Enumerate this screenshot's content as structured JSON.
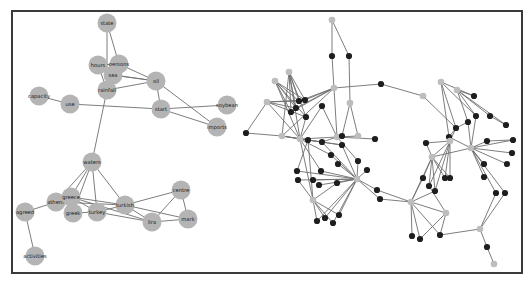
{
  "figure": {
    "colors": {
      "border": "#3a3a3a",
      "edge": "#6e6e6e",
      "word_node": "#b4b4b4",
      "dark_node": "#1e1e1e",
      "light_node": "#bdbdbd",
      "label": "#1a1a1a"
    }
  },
  "left_network": {
    "nodes": [
      {
        "id": "state",
        "label": "state",
        "x": 107,
        "y": 23
      },
      {
        "id": "hours",
        "label": "hours",
        "x": 98,
        "y": 65
      },
      {
        "id": "persons",
        "label": "persons",
        "x": 119,
        "y": 64
      },
      {
        "id": "sea",
        "label": "sea",
        "x": 113,
        "y": 75
      },
      {
        "id": "rainfall",
        "label": "rainfall",
        "x": 107,
        "y": 90
      },
      {
        "id": "oil",
        "label": "oil",
        "x": 156,
        "y": 81
      },
      {
        "id": "capacity",
        "label": "capacity",
        "x": 39,
        "y": 96
      },
      {
        "id": "use",
        "label": "use",
        "x": 70,
        "y": 104
      },
      {
        "id": "start",
        "label": "start",
        "x": 161,
        "y": 109
      },
      {
        "id": "soybean",
        "label": "soybean",
        "x": 227,
        "y": 105
      },
      {
        "id": "imports",
        "label": "imports",
        "x": 217,
        "y": 127
      },
      {
        "id": "waters",
        "label": "waters",
        "x": 92,
        "y": 162
      },
      {
        "id": "athens",
        "label": "athens",
        "x": 56,
        "y": 202
      },
      {
        "id": "greece",
        "label": "greece",
        "x": 71,
        "y": 197
      },
      {
        "id": "greek",
        "label": "greek",
        "x": 73,
        "y": 213
      },
      {
        "id": "turkey",
        "label": "turkey",
        "x": 97,
        "y": 212
      },
      {
        "id": "turkish",
        "label": "turkish",
        "x": 125,
        "y": 205
      },
      {
        "id": "centre",
        "label": "centre",
        "x": 181,
        "y": 190
      },
      {
        "id": "lira",
        "label": "lira",
        "x": 152,
        "y": 222
      },
      {
        "id": "mark",
        "label": "mark",
        "x": 188,
        "y": 219
      },
      {
        "id": "agreed",
        "label": "agreed",
        "x": 25,
        "y": 212
      },
      {
        "id": "activities",
        "label": "activities",
        "x": 35,
        "y": 256
      }
    ],
    "edges": [
      [
        "state",
        "persons"
      ],
      [
        "state",
        "rainfall"
      ],
      [
        "hours",
        "persons"
      ],
      [
        "hours",
        "rainfall"
      ],
      [
        "persons",
        "oil"
      ],
      [
        "sea",
        "oil"
      ],
      [
        "persons",
        "sea"
      ],
      [
        "sea",
        "rainfall"
      ],
      [
        "rainfall",
        "oil"
      ],
      [
        "oil",
        "start"
      ],
      [
        "oil",
        "imports"
      ],
      [
        "capacity",
        "use"
      ],
      [
        "use",
        "start"
      ],
      [
        "start",
        "soybean"
      ],
      [
        "start",
        "imports"
      ],
      [
        "rainfall",
        "waters"
      ],
      [
        "sea",
        "oil"
      ],
      [
        "waters",
        "athens"
      ],
      [
        "waters",
        "greece"
      ],
      [
        "waters",
        "greek"
      ],
      [
        "waters",
        "turkey"
      ],
      [
        "waters",
        "turkish"
      ],
      [
        "athens",
        "greece"
      ],
      [
        "athens",
        "agreed"
      ],
      [
        "agreed",
        "activities"
      ],
      [
        "greece",
        "turkey"
      ],
      [
        "greece",
        "turkish"
      ],
      [
        "greece",
        "greek"
      ],
      [
        "greek",
        "turkey"
      ],
      [
        "turkey",
        "turkish"
      ],
      [
        "turkey",
        "lira"
      ],
      [
        "greece",
        "lira"
      ],
      [
        "turkish",
        "centre"
      ],
      [
        "turkish",
        "mark"
      ],
      [
        "turkish",
        "lira"
      ],
      [
        "centre",
        "lira"
      ],
      [
        "centre",
        "mark"
      ],
      [
        "lira",
        "mark"
      ],
      [
        "athens",
        "turkish"
      ]
    ]
  },
  "right_network": {
    "nodes": [
      {
        "x": 332,
        "y": 20,
        "t": "light"
      },
      {
        "x": 332,
        "y": 56,
        "t": "dark"
      },
      {
        "x": 349,
        "y": 56,
        "t": "dark"
      },
      {
        "x": 289,
        "y": 72,
        "t": "light"
      },
      {
        "x": 275,
        "y": 81,
        "t": "light"
      },
      {
        "x": 334,
        "y": 88,
        "t": "light"
      },
      {
        "x": 267,
        "y": 102,
        "t": "light"
      },
      {
        "x": 299,
        "y": 101,
        "t": "dark"
      },
      {
        "x": 305,
        "y": 100,
        "t": "dark"
      },
      {
        "x": 296,
        "y": 108,
        "t": "dark"
      },
      {
        "x": 322,
        "y": 106,
        "t": "dark"
      },
      {
        "x": 291,
        "y": 112,
        "t": "dark"
      },
      {
        "x": 306,
        "y": 117,
        "t": "dark"
      },
      {
        "x": 350,
        "y": 103,
        "t": "light"
      },
      {
        "x": 246,
        "y": 133,
        "t": "dark"
      },
      {
        "x": 282,
        "y": 136,
        "t": "light"
      },
      {
        "x": 300,
        "y": 139,
        "t": "light"
      },
      {
        "x": 337,
        "y": 137,
        "t": "light"
      },
      {
        "x": 342,
        "y": 136,
        "t": "dark"
      },
      {
        "x": 381,
        "y": 84,
        "t": "dark"
      },
      {
        "x": 423,
        "y": 96,
        "t": "light"
      },
      {
        "x": 441,
        "y": 82,
        "t": "light"
      },
      {
        "x": 457,
        "y": 90,
        "t": "light"
      },
      {
        "x": 474,
        "y": 96,
        "t": "dark"
      },
      {
        "x": 456,
        "y": 128,
        "t": "dark"
      },
      {
        "x": 476,
        "y": 116,
        "t": "dark"
      },
      {
        "x": 490,
        "y": 116,
        "t": "dark"
      },
      {
        "x": 449,
        "y": 137,
        "t": "dark"
      },
      {
        "x": 468,
        "y": 122,
        "t": "dark"
      },
      {
        "x": 506,
        "y": 125,
        "t": "dark"
      },
      {
        "x": 308,
        "y": 140,
        "t": "dark"
      },
      {
        "x": 358,
        "y": 136,
        "t": "light"
      },
      {
        "x": 375,
        "y": 139,
        "t": "dark"
      },
      {
        "x": 342,
        "y": 145,
        "t": "dark"
      },
      {
        "x": 358,
        "y": 161,
        "t": "dark"
      },
      {
        "x": 322,
        "y": 142,
        "t": "dark"
      },
      {
        "x": 331,
        "y": 155,
        "t": "dark"
      },
      {
        "x": 338,
        "y": 164,
        "t": "dark"
      },
      {
        "x": 321,
        "y": 171,
        "t": "dark"
      },
      {
        "x": 367,
        "y": 170,
        "t": "dark"
      },
      {
        "x": 297,
        "y": 171,
        "t": "dark"
      },
      {
        "x": 298,
        "y": 180,
        "t": "dark"
      },
      {
        "x": 313,
        "y": 180,
        "t": "dark"
      },
      {
        "x": 319,
        "y": 185,
        "t": "dark"
      },
      {
        "x": 337,
        "y": 183,
        "t": "dark"
      },
      {
        "x": 313,
        "y": 200,
        "t": "light"
      },
      {
        "x": 357,
        "y": 179,
        "t": "light"
      },
      {
        "x": 377,
        "y": 190,
        "t": "dark"
      },
      {
        "x": 380,
        "y": 199,
        "t": "dark"
      },
      {
        "x": 317,
        "y": 221,
        "t": "dark"
      },
      {
        "x": 325,
        "y": 218,
        "t": "dark"
      },
      {
        "x": 333,
        "y": 223,
        "t": "dark"
      },
      {
        "x": 339,
        "y": 215,
        "t": "dark"
      },
      {
        "x": 426,
        "y": 143,
        "t": "dark"
      },
      {
        "x": 450,
        "y": 141,
        "t": "light"
      },
      {
        "x": 471,
        "y": 148,
        "t": "light"
      },
      {
        "x": 487,
        "y": 141,
        "t": "dark"
      },
      {
        "x": 513,
        "y": 140,
        "t": "dark"
      },
      {
        "x": 512,
        "y": 153,
        "t": "dark"
      },
      {
        "x": 507,
        "y": 164,
        "t": "dark"
      },
      {
        "x": 484,
        "y": 164,
        "t": "dark"
      },
      {
        "x": 484,
        "y": 177,
        "t": "dark"
      },
      {
        "x": 432,
        "y": 157,
        "t": "light"
      },
      {
        "x": 423,
        "y": 178,
        "t": "dark"
      },
      {
        "x": 445,
        "y": 178,
        "t": "dark"
      },
      {
        "x": 429,
        "y": 186,
        "t": "dark"
      },
      {
        "x": 435,
        "y": 191,
        "t": "dark"
      },
      {
        "x": 411,
        "y": 202,
        "t": "light"
      },
      {
        "x": 450,
        "y": 178,
        "t": "dark"
      },
      {
        "x": 496,
        "y": 193,
        "t": "dark"
      },
      {
        "x": 505,
        "y": 193,
        "t": "dark"
      },
      {
        "x": 446,
        "y": 213,
        "t": "light"
      },
      {
        "x": 412,
        "y": 236,
        "t": "dark"
      },
      {
        "x": 420,
        "y": 239,
        "t": "dark"
      },
      {
        "x": 440,
        "y": 235,
        "t": "dark"
      },
      {
        "x": 480,
        "y": 229,
        "t": "light"
      },
      {
        "x": 487,
        "y": 247,
        "t": "dark"
      },
      {
        "x": 494,
        "y": 264,
        "t": "light"
      }
    ],
    "edges": [
      [
        0,
        1
      ],
      [
        0,
        2
      ],
      [
        1,
        17
      ],
      [
        2,
        13
      ],
      [
        13,
        18
      ],
      [
        13,
        31
      ],
      [
        3,
        7
      ],
      [
        3,
        8
      ],
      [
        3,
        9
      ],
      [
        3,
        11
      ],
      [
        3,
        12
      ],
      [
        3,
        15
      ],
      [
        3,
        16
      ],
      [
        4,
        7
      ],
      [
        4,
        8
      ],
      [
        4,
        9
      ],
      [
        4,
        11
      ],
      [
        4,
        12
      ],
      [
        4,
        16
      ],
      [
        5,
        7
      ],
      [
        5,
        8
      ],
      [
        5,
        9
      ],
      [
        5,
        11
      ],
      [
        5,
        15
      ],
      [
        5,
        19
      ],
      [
        6,
        7
      ],
      [
        6,
        8
      ],
      [
        6,
        9
      ],
      [
        6,
        12
      ],
      [
        6,
        14
      ],
      [
        6,
        16
      ],
      [
        10,
        16
      ],
      [
        10,
        17
      ],
      [
        12,
        16
      ],
      [
        14,
        15
      ],
      [
        15,
        16
      ],
      [
        16,
        17
      ],
      [
        17,
        18
      ],
      [
        19,
        20
      ],
      [
        20,
        24
      ],
      [
        21,
        23
      ],
      [
        21,
        24
      ],
      [
        21,
        25
      ],
      [
        21,
        27
      ],
      [
        22,
        23
      ],
      [
        22,
        26
      ],
      [
        22,
        28
      ],
      [
        22,
        29
      ],
      [
        22,
        25
      ],
      [
        24,
        27
      ],
      [
        24,
        28
      ],
      [
        26,
        29
      ],
      [
        15,
        30
      ],
      [
        15,
        33
      ],
      [
        16,
        33
      ],
      [
        16,
        35
      ],
      [
        16,
        36
      ],
      [
        16,
        38
      ],
      [
        17,
        31
      ],
      [
        17,
        32
      ],
      [
        17,
        34
      ],
      [
        17,
        35
      ],
      [
        30,
        45
      ],
      [
        30,
        40
      ],
      [
        33,
        46
      ],
      [
        35,
        46
      ],
      [
        36,
        46
      ],
      [
        37,
        46
      ],
      [
        38,
        46
      ],
      [
        34,
        46
      ],
      [
        40,
        46
      ],
      [
        41,
        46
      ],
      [
        42,
        46
      ],
      [
        43,
        46
      ],
      [
        44,
        46
      ],
      [
        39,
        46
      ],
      [
        45,
        49
      ],
      [
        45,
        50
      ],
      [
        45,
        51
      ],
      [
        45,
        52
      ],
      [
        46,
        49
      ],
      [
        46,
        50
      ],
      [
        46,
        51
      ],
      [
        46,
        52
      ],
      [
        46,
        47
      ],
      [
        46,
        48
      ],
      [
        41,
        45
      ],
      [
        44,
        45
      ],
      [
        16,
        45
      ],
      [
        53,
        54
      ],
      [
        53,
        62
      ],
      [
        54,
        62
      ],
      [
        54,
        64
      ],
      [
        54,
        65
      ],
      [
        54,
        66
      ],
      [
        54,
        68
      ],
      [
        55,
        56
      ],
      [
        55,
        57
      ],
      [
        55,
        58
      ],
      [
        55,
        59
      ],
      [
        55,
        60
      ],
      [
        55,
        61
      ],
      [
        55,
        62
      ],
      [
        56,
        57
      ],
      [
        28,
        55
      ],
      [
        24,
        54
      ],
      [
        25,
        55
      ],
      [
        27,
        55
      ],
      [
        62,
        63
      ],
      [
        62,
        64
      ],
      [
        62,
        65
      ],
      [
        62,
        66
      ],
      [
        62,
        67
      ],
      [
        62,
        68
      ],
      [
        67,
        72
      ],
      [
        67,
        73
      ],
      [
        67,
        74
      ],
      [
        67,
        71
      ],
      [
        71,
        74
      ],
      [
        71,
        73
      ],
      [
        63,
        67
      ],
      [
        65,
        71
      ],
      [
        66,
        67
      ],
      [
        55,
        69
      ],
      [
        55,
        70
      ],
      [
        69,
        75
      ],
      [
        70,
        75
      ],
      [
        75,
        76
      ],
      [
        76,
        77
      ],
      [
        74,
        75
      ],
      [
        48,
        67
      ],
      [
        47,
        67
      ]
    ]
  }
}
